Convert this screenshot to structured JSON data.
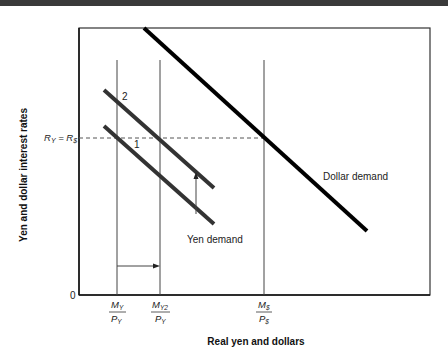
{
  "figure": {
    "y_axis_title": "Yen and dollar interest rates",
    "x_axis_title": "Real yen and dollars",
    "origin_label": "0",
    "rate_label": "R",
    "rate_label_sub1": "Y",
    "rate_label_eq": " = R",
    "rate_label_sub2": "$",
    "curves": {
      "dollar_demand": "Dollar demand",
      "yen_demand": "Yen demand",
      "yen_curve_1": "1",
      "yen_curve_2": "2"
    },
    "x_ticks": [
      {
        "num": "M",
        "num_sub": "Y",
        "den": "P",
        "den_sub": "Y"
      },
      {
        "num": "M",
        "num_sub": "Y2",
        "den": "P",
        "den_sub": "Y"
      },
      {
        "num": "M",
        "num_sub": "$",
        "den": "P",
        "den_sub": "$"
      }
    ],
    "colors": {
      "curve": "#000000",
      "yen_curve": "#333333",
      "frame": "#222222",
      "guide": "#555555"
    }
  }
}
